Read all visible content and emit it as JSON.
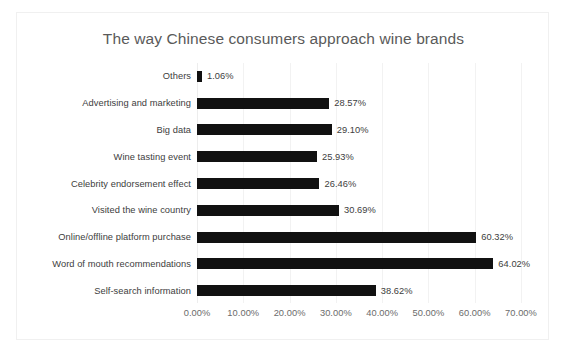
{
  "chart_data": {
    "type": "bar",
    "orientation": "horizontal",
    "title": "The way Chinese consumers approach wine brands",
    "xlabel": "",
    "ylabel": "",
    "xlim": [
      0,
      70
    ],
    "xtick_labels": [
      "0.00%",
      "10.00%",
      "20.00%",
      "30.00%",
      "40.00%",
      "50.00%",
      "60.00%",
      "70.00%"
    ],
    "xticks": [
      0,
      10,
      20,
      30,
      40,
      50,
      60,
      70
    ],
    "grid": true,
    "legend": false,
    "bar_color": "#111111",
    "categories": [
      "Others",
      "Advertising and marketing",
      "Big data",
      "Wine tasting event",
      "Celebrity endorsement effect",
      "Visited the wine country",
      "Online/offline platform purchase",
      "Word of mouth recommendations",
      "Self-search information"
    ],
    "values": [
      1.06,
      28.57,
      29.1,
      25.93,
      26.46,
      30.69,
      60.32,
      64.02,
      38.62
    ],
    "data_labels": [
      "1.06%",
      "28.57%",
      "29.10%",
      "25.93%",
      "26.46%",
      "30.69%",
      "60.32%",
      "64.02%",
      "38.62%"
    ]
  }
}
